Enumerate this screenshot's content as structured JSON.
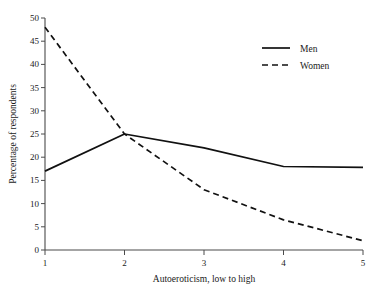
{
  "chart_data": {
    "type": "line",
    "title": "",
    "xlabel": "Autoeroticism, low to high",
    "ylabel": "Percentage of respondents",
    "x": [
      1,
      2,
      3,
      4,
      5
    ],
    "xticklabels": [
      "1",
      "2",
      "3",
      "4",
      "5"
    ],
    "yticks": [
      0,
      5,
      10,
      15,
      20,
      25,
      30,
      35,
      40,
      45,
      50
    ],
    "yticklabels": [
      "0",
      "5",
      "10",
      "15",
      "20",
      "25",
      "30",
      "35",
      "40",
      "45",
      "50"
    ],
    "xlim": [
      1,
      5
    ],
    "ylim": [
      0,
      50
    ],
    "grid": false,
    "legend_position": "upper right",
    "series": [
      {
        "name": "Men",
        "linestyle": "solid",
        "color": "#111111",
        "values": [
          17,
          25,
          22,
          18,
          17.8
        ]
      },
      {
        "name": "Women",
        "linestyle": "dashed",
        "color": "#111111",
        "values": [
          48,
          25,
          13,
          6.5,
          2
        ]
      }
    ]
  },
  "legend": {
    "items": [
      {
        "label": "Men"
      },
      {
        "label": "Women"
      }
    ]
  }
}
